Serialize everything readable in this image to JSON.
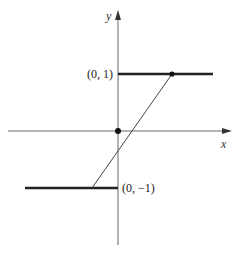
{
  "diagram": {
    "type": "piecewise-function-graph",
    "axes": {
      "x_label": "x",
      "y_label": "y"
    },
    "labels": {
      "upper": "(0, 1)",
      "lower": "(0, −1)"
    },
    "segments": [
      {
        "name": "upper-horizontal",
        "from": [
          0,
          1
        ],
        "to": [
          1.7,
          1
        ],
        "style": "thick"
      },
      {
        "name": "lower-horizontal",
        "from": [
          -1.7,
          -1
        ],
        "to": [
          0,
          -1
        ],
        "style": "thick"
      },
      {
        "name": "slope-line",
        "from": [
          -0.5,
          -1
        ],
        "to": [
          1,
          1
        ],
        "style": "thin"
      }
    ],
    "points": [
      {
        "name": "origin-dot",
        "at": [
          0,
          0
        ]
      },
      {
        "name": "upper-dot",
        "at": [
          1,
          1
        ]
      }
    ],
    "colors": {
      "line": "#222222",
      "axis": "#555555",
      "background": "#ffffff"
    }
  }
}
